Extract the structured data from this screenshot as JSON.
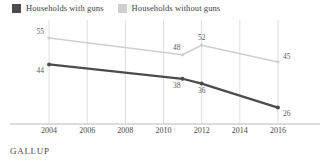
{
  "legend": {
    "position": "top-left",
    "items": [
      {
        "label": "Households with guns",
        "swatch": "dark",
        "color": "#4c4c4c"
      },
      {
        "label": "Households without guns",
        "swatch": "light",
        "color": "#cfcfcf"
      }
    ]
  },
  "source": {
    "label": "GALLUP"
  },
  "chart_data": {
    "type": "line",
    "title": "",
    "subtitle": "",
    "xlabel": "",
    "ylabel": "",
    "grid": "vertical",
    "legend_position": "top-left",
    "xlim": [
      2003,
      2017
    ],
    "ylim": [
      20,
      60
    ],
    "xticks": [
      2004,
      2006,
      2008,
      2010,
      2012,
      2014,
      2016
    ],
    "xtick_labels": [
      "2004",
      "2006",
      "2008",
      "2010",
      "2012",
      "2014",
      "2016"
    ],
    "x": [
      2004,
      2011,
      2012,
      2016
    ],
    "series": [
      {
        "name": "Households without guns",
        "color": "#cfcfcf",
        "values": [
          55,
          48,
          52,
          45
        ],
        "labels": [
          "55",
          "48",
          "52",
          "45"
        ]
      },
      {
        "name": "Households with guns",
        "color": "#4c4c4c",
        "values": [
          44,
          38,
          36,
          26
        ],
        "labels": [
          "44",
          "38",
          "36",
          "26"
        ]
      }
    ]
  }
}
